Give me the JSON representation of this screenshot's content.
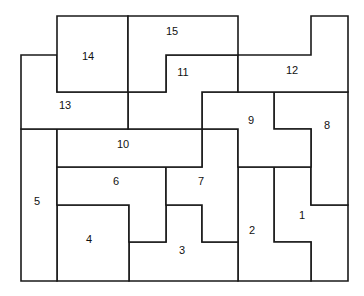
{
  "diagram": {
    "type": "rectilinear-region-puzzle",
    "stroke_color": "#1a1a1a",
    "fill_color": "#ffffff",
    "regions": [
      {
        "id": "1",
        "label": "1",
        "points": "274,167 311,167 311,205 348,205 348,281 311,281 311,242 274,242",
        "lx": 302,
        "ly": 216
      },
      {
        "id": "2",
        "label": "2",
        "points": "238,167 274,167 274,242 311,242 311,281 238,281",
        "lx": 252,
        "ly": 231
      },
      {
        "id": "3",
        "label": "3",
        "points": "166,205 202,205 202,242 238,242 238,281 129,281 129,242 166,242",
        "lx": 182,
        "ly": 251
      },
      {
        "id": "4",
        "label": "4",
        "points": "57,205 129,205 129,281 57,281",
        "lx": 89,
        "ly": 240
      },
      {
        "id": "5",
        "label": "5",
        "points": "21,129 57,129 57,281 21,281",
        "lx": 37,
        "ly": 202
      },
      {
        "id": "6",
        "label": "6",
        "points": "57,167 166,167 166,242 129,242 129,205 57,205",
        "lx": 116,
        "ly": 182
      },
      {
        "id": "7",
        "label": "7",
        "points": "166,167 202,167 202,129 238,129 238,242 202,242 202,205 166,205",
        "lx": 201,
        "ly": 182
      },
      {
        "id": "8",
        "label": "8",
        "points": "274,92 348,92 348,205 311,205 311,129 274,129",
        "lx": 327,
        "ly": 126
      },
      {
        "id": "9",
        "label": "9",
        "points": "202,92 274,92 274,129 311,129 311,167 238,167 238,129 202,129",
        "lx": 251,
        "ly": 121
      },
      {
        "id": "10",
        "label": "10",
        "points": "57,129 202,129 202,167 57,167",
        "lx": 123,
        "ly": 145
      },
      {
        "id": "11",
        "label": "11",
        "points": "166,55 238,55 238,92 202,92 202,129 128,129 128,92 166,92",
        "lx": 183,
        "ly": 73
      },
      {
        "id": "12",
        "label": "12",
        "points": "311,16 348,16 348,92 238,92 238,55 311,55",
        "lx": 292,
        "ly": 71
      },
      {
        "id": "13",
        "label": "13",
        "points": "21,55 57,55 57,92 128,92 128,129 21,129",
        "lx": 65,
        "ly": 106
      },
      {
        "id": "14",
        "label": "14",
        "points": "57,16 128,16 128,92 57,92",
        "lx": 88,
        "ly": 57
      },
      {
        "id": "15",
        "label": "15",
        "points": "128,16 238,16 238,55 166,55 166,92 128,92",
        "lx": 172,
        "ly": 32
      }
    ]
  }
}
